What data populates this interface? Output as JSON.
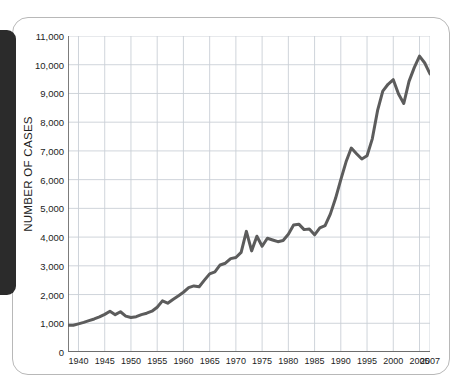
{
  "page": {
    "background_color": "#ffffff",
    "card_border_color": "#b8b8b8",
    "edge_tab_color": "#2b2b2b",
    "edge_tab_name": "black-index-tab"
  },
  "chart_data": {
    "type": "line",
    "title": "",
    "subtitle": "",
    "xlabel": "",
    "ylabel": "NUMBER OF CASES",
    "xlim": [
      1938,
      2007
    ],
    "ylim": [
      0,
      11000
    ],
    "grid": true,
    "legend_position": "none",
    "line_color": "#5c5c5c",
    "line_width": 3,
    "grid_color": "#c9cfd6",
    "axis_color": "#6e6e6e",
    "y_ticks": [
      0,
      1000,
      2000,
      3000,
      4000,
      5000,
      6000,
      7000,
      8000,
      9000,
      10000,
      11000
    ],
    "y_tick_labels": [
      "0",
      "1,000",
      "2,000",
      "3,000",
      "4,000",
      "5,000",
      "6,000",
      "7,000",
      "8,000",
      "9,000",
      "10,000",
      "11,000"
    ],
    "x_ticks": [
      1940,
      1945,
      1950,
      1955,
      1960,
      1965,
      1970,
      1975,
      1980,
      1985,
      1990,
      1995,
      2000,
      2005,
      2007
    ],
    "x_tick_labels": [
      "1940",
      "1945",
      "1950",
      "1955",
      "1960",
      "1965",
      "1970",
      "1975",
      "1980",
      "1985",
      "1990",
      "1995",
      "2000",
      "2005",
      "2007"
    ],
    "x": [
      1938,
      1939,
      1940,
      1941,
      1942,
      1943,
      1944,
      1945,
      1946,
      1947,
      1948,
      1949,
      1950,
      1951,
      1952,
      1953,
      1954,
      1955,
      1956,
      1957,
      1958,
      1959,
      1960,
      1961,
      1962,
      1963,
      1964,
      1965,
      1966,
      1967,
      1968,
      1969,
      1970,
      1971,
      1972,
      1973,
      1974,
      1975,
      1976,
      1977,
      1978,
      1979,
      1980,
      1981,
      1982,
      1983,
      1984,
      1985,
      1986,
      1987,
      1988,
      1989,
      1990,
      1991,
      1992,
      1993,
      1994,
      1995,
      1996,
      1997,
      1998,
      1999,
      2000,
      2001,
      2002,
      2003,
      2004,
      2005,
      2006,
      2007
    ],
    "y": [
      930,
      930,
      980,
      1030,
      1090,
      1150,
      1220,
      1310,
      1420,
      1300,
      1400,
      1250,
      1200,
      1230,
      1300,
      1350,
      1420,
      1560,
      1780,
      1700,
      1830,
      1950,
      2080,
      2240,
      2300,
      2270,
      2500,
      2720,
      2790,
      3030,
      3090,
      3250,
      3290,
      3470,
      4200,
      3520,
      4030,
      3680,
      3960,
      3900,
      3840,
      3880,
      4100,
      4420,
      4450,
      4260,
      4280,
      4080,
      4320,
      4400,
      4800,
      5350,
      6000,
      6620,
      7100,
      6900,
      6720,
      6830,
      7420,
      8400,
      9080,
      9320,
      9480,
      8980,
      8650,
      9420,
      9900,
      10300,
      10060,
      9680
    ],
    "series": [
      {
        "name": "Number of cases",
        "values": [
          930,
          930,
          980,
          1030,
          1090,
          1150,
          1220,
          1310,
          1420,
          1300,
          1400,
          1250,
          1200,
          1230,
          1300,
          1350,
          1420,
          1560,
          1780,
          1700,
          1830,
          1950,
          2080,
          2240,
          2300,
          2270,
          2500,
          2720,
          2790,
          3030,
          3090,
          3250,
          3290,
          3470,
          4200,
          3520,
          4030,
          3680,
          3960,
          3900,
          3840,
          3880,
          4100,
          4420,
          4450,
          4260,
          4280,
          4080,
          4320,
          4400,
          4800,
          5350,
          6000,
          6620,
          7100,
          6900,
          6720,
          6830,
          7420,
          8400,
          9080,
          9320,
          9480,
          8980,
          8650,
          9420,
          9900,
          10300,
          10060,
          9680
        ]
      }
    ],
    "annotations": []
  }
}
